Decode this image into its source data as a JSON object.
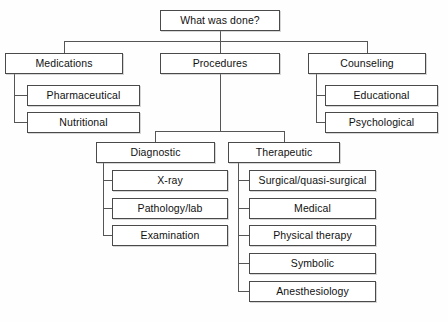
{
  "diagram": {
    "title": "What was done?",
    "type": "hierarchy-tree",
    "orientation": "top-down-with-left-elbows",
    "background_color": "#fefefe",
    "box_fill_color": "#ffffff",
    "box_border_color": "#4a4a4a",
    "connector_color": "#555555",
    "text_color": "#111111",
    "levels": 4,
    "node_count": 16
  },
  "nodes": {
    "root": {
      "id": "root",
      "label": "What was done?",
      "level": 0,
      "x": 160,
      "y": 10,
      "w": 120,
      "h": 21
    },
    "medications": {
      "id": "medications",
      "label": "Medications",
      "level": 1,
      "x": 5,
      "y": 53,
      "w": 118,
      "h": 21
    },
    "pharmaceutical": {
      "id": "pharmaceutical",
      "label": "Pharmaceutical",
      "level": 2,
      "x": 27,
      "y": 85,
      "w": 113,
      "h": 21
    },
    "nutritional": {
      "id": "nutritional",
      "label": "Nutritional",
      "level": 2,
      "x": 27,
      "y": 112,
      "w": 113,
      "h": 21
    },
    "procedures": {
      "id": "procedures",
      "label": "Procedures",
      "level": 1,
      "x": 160,
      "y": 53,
      "w": 120,
      "h": 21
    },
    "diagnostic": {
      "id": "diagnostic",
      "label": "Diagnostic",
      "level": 2,
      "x": 96,
      "y": 142,
      "w": 119,
      "h": 21
    },
    "xray": {
      "id": "xray",
      "label": "X-ray",
      "level": 3,
      "x": 112,
      "y": 170,
      "w": 116,
      "h": 21
    },
    "pathology": {
      "id": "pathology",
      "label": "Pathology/lab",
      "level": 3,
      "x": 112,
      "y": 198,
      "w": 116,
      "h": 21
    },
    "examination": {
      "id": "examination",
      "label": "Examination",
      "level": 3,
      "x": 112,
      "y": 225,
      "w": 116,
      "h": 21
    },
    "therapeutic": {
      "id": "therapeutic",
      "label": "Therapeutic",
      "level": 2,
      "x": 228,
      "y": 142,
      "w": 112,
      "h": 21
    },
    "surgical": {
      "id": "surgical",
      "label": "Surgical/quasi-surgical",
      "level": 3,
      "x": 249,
      "y": 170,
      "w": 127,
      "h": 21
    },
    "medical": {
      "id": "medical",
      "label": "Medical",
      "level": 3,
      "x": 249,
      "y": 198,
      "w": 127,
      "h": 21
    },
    "physical_therapy": {
      "id": "physical_therapy",
      "label": "Physical therapy",
      "level": 3,
      "x": 249,
      "y": 225,
      "w": 127,
      "h": 21
    },
    "symbolic": {
      "id": "symbolic",
      "label": "Symbolic",
      "level": 3,
      "x": 249,
      "y": 253,
      "w": 127,
      "h": 21
    },
    "anesthesiology": {
      "id": "anesthesiology",
      "label": "Anesthesiology",
      "level": 3,
      "x": 249,
      "y": 281,
      "w": 127,
      "h": 21
    },
    "counseling": {
      "id": "counseling",
      "label": "Counseling",
      "level": 1,
      "x": 308,
      "y": 53,
      "w": 118,
      "h": 21
    },
    "educational": {
      "id": "educational",
      "label": "Educational",
      "level": 2,
      "x": 325,
      "y": 85,
      "w": 113,
      "h": 21
    },
    "psychological": {
      "id": "psychological",
      "label": "Psychological",
      "level": 2,
      "x": 325,
      "y": 112,
      "w": 113,
      "h": 21
    }
  },
  "edges": [
    {
      "from": "root",
      "to": "medications"
    },
    {
      "from": "root",
      "to": "procedures"
    },
    {
      "from": "root",
      "to": "counseling"
    },
    {
      "from": "medications",
      "to": "pharmaceutical"
    },
    {
      "from": "medications",
      "to": "nutritional"
    },
    {
      "from": "procedures",
      "to": "diagnostic"
    },
    {
      "from": "procedures",
      "to": "therapeutic"
    },
    {
      "from": "diagnostic",
      "to": "xray"
    },
    {
      "from": "diagnostic",
      "to": "pathology"
    },
    {
      "from": "diagnostic",
      "to": "examination"
    },
    {
      "from": "therapeutic",
      "to": "surgical"
    },
    {
      "from": "therapeutic",
      "to": "medical"
    },
    {
      "from": "therapeutic",
      "to": "physical_therapy"
    },
    {
      "from": "therapeutic",
      "to": "symbolic"
    },
    {
      "from": "therapeutic",
      "to": "anesthesiology"
    },
    {
      "from": "counseling",
      "to": "educational"
    },
    {
      "from": "counseling",
      "to": "psychological"
    }
  ]
}
